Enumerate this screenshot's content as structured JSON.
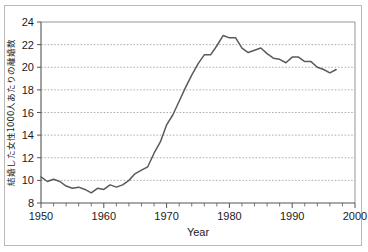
{
  "figure": {
    "background": "#ffffff",
    "frame_color": "#b9b9b9"
  },
  "chart_data": {
    "type": "line",
    "title": "",
    "xlabel": "Year",
    "ylabel": "結婚した女性1000人あたりの離婚数",
    "xlim": [
      1950,
      2000
    ],
    "ylim": [
      8,
      24
    ],
    "xticks": [
      1950,
      1960,
      1970,
      1980,
      1990,
      2000
    ],
    "xtick_labels": [
      "1950",
      "1960",
      "1970",
      "1980",
      "1990",
      "2000"
    ],
    "x_minor_tick_step": 2,
    "yticks": [
      8,
      10,
      12,
      14,
      16,
      18,
      20,
      22,
      24
    ],
    "ytick_labels": [
      "8",
      "10",
      "12",
      "14",
      "16",
      "18",
      "20",
      "22",
      "24"
    ],
    "grid": "horizontal-dotted",
    "legend": "none",
    "line_color": "#5a5a5a",
    "series": [
      {
        "name": "divorces-per-1000-married-women",
        "x": [
          1950,
          1951,
          1952,
          1953,
          1954,
          1955,
          1956,
          1957,
          1958,
          1959,
          1960,
          1961,
          1962,
          1963,
          1964,
          1965,
          1966,
          1967,
          1968,
          1969,
          1970,
          1971,
          1972,
          1973,
          1974,
          1975,
          1976,
          1977,
          1978,
          1979,
          1980,
          1981,
          1982,
          1983,
          1984,
          1985,
          1986,
          1987,
          1988,
          1989,
          1990,
          1991,
          1992,
          1993,
          1994,
          1995,
          1996,
          1997
        ],
        "y": [
          10.3,
          9.9,
          10.1,
          9.9,
          9.5,
          9.3,
          9.4,
          9.2,
          8.9,
          9.3,
          9.2,
          9.6,
          9.4,
          9.6,
          10.0,
          10.6,
          10.9,
          11.2,
          12.4,
          13.4,
          14.9,
          15.8,
          17.0,
          18.2,
          19.3,
          20.3,
          21.1,
          21.1,
          21.9,
          22.8,
          22.6,
          22.6,
          21.7,
          21.3,
          21.5,
          21.7,
          21.2,
          20.8,
          20.7,
          20.4,
          20.9,
          20.9,
          20.5,
          20.5,
          20.0,
          19.8,
          19.5,
          19.8
        ]
      }
    ]
  },
  "axes": {
    "x_axis_title": "Year",
    "y_axis_title": "結婚した女性1000人あたりの離婚数"
  }
}
